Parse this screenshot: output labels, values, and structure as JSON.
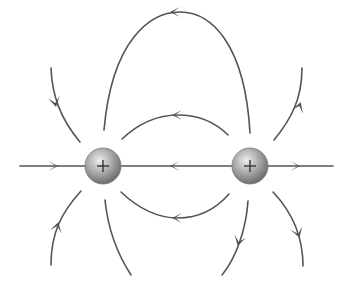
{
  "diagram": {
    "type": "electric-field-lines",
    "colors": {
      "line": "#555555",
      "charge_light": "#e6e6e6",
      "charge_dark": "#7a7a7a",
      "sign": "#333333"
    },
    "charges": [
      {
        "id": "charge-left",
        "sign": "+",
        "cx": 103,
        "cy": 166,
        "r": 18
      },
      {
        "id": "charge-right",
        "sign": "+",
        "cx": 250,
        "cy": 166,
        "r": 18
      }
    ],
    "field_lines": [
      {
        "id": "axis-left",
        "direction": "toward left charge"
      },
      {
        "id": "axis-middle",
        "direction": "toward left charge"
      },
      {
        "id": "axis-right",
        "direction": "away from right charge"
      },
      {
        "id": "top-outer-arch",
        "direction": "right to left"
      },
      {
        "id": "upper-inner-arch",
        "direction": "right to left"
      },
      {
        "id": "lower-inner-arch",
        "direction": "right to left"
      },
      {
        "id": "upper-left-curve",
        "direction": "downward toward left charge"
      },
      {
        "id": "lower-left-curve",
        "direction": "upward toward left charge"
      },
      {
        "id": "upper-right-curve",
        "direction": "upward away from right charge"
      },
      {
        "id": "lower-right-curve-inner",
        "direction": "downward away from right charge"
      },
      {
        "id": "lower-right-curve-outer",
        "direction": "downward away from right charge"
      },
      {
        "id": "lower-center-curve",
        "direction": "none shown"
      }
    ]
  }
}
